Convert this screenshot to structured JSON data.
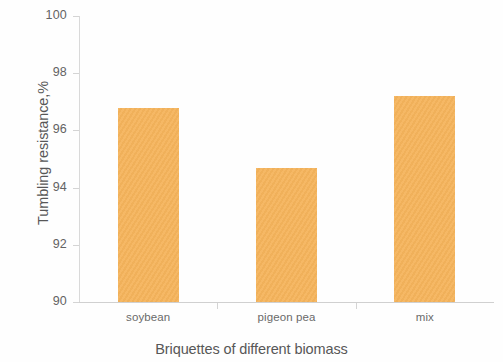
{
  "chart_data": {
    "type": "bar",
    "title": "",
    "categories": [
      "soybean",
      "pigeon pea",
      "mix"
    ],
    "values": [
      96.8,
      94.7,
      97.2
    ],
    "series": [
      {
        "name": "Tumbling resistance",
        "values": [
          96.8,
          94.7,
          97.2
        ]
      }
    ],
    "xlabel": "Briquettes of different biomass",
    "ylabel": "Tumbling resistance,%",
    "ylim": [
      90,
      100
    ],
    "y_ticks": [
      90,
      92,
      94,
      96,
      98,
      100
    ],
    "y_tick_labels": [
      "90",
      "92",
      "94",
      "96",
      "98",
      "100"
    ],
    "grid": false,
    "legend": false,
    "bar_color": "#f5b45c",
    "axis_color": "#d4d4d4",
    "background_color": "#fefefe"
  },
  "axes": {
    "y_title": "Tumbling resistance,%",
    "x_title": "Briquettes of different biomass"
  }
}
